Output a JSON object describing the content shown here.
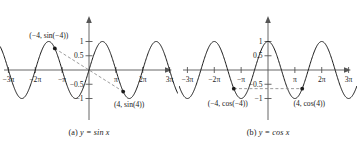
{
  "figure": {
    "panels": [
      {
        "id": "a",
        "caption_prefix": "(a) ",
        "caption_equation": "y = sin x",
        "curve_color": "#1a1a1a",
        "axis_color": "#555555",
        "dash_color": "#8a8a8a",
        "point_color": "#1a1a1a",
        "x_ticks": [
          "−3π",
          "−2π",
          "−π",
          "π",
          "2π",
          "3π"
        ],
        "y_ticks": [
          "1",
          "0.5",
          "−0.5",
          "−1"
        ],
        "points": [
          {
            "name": "point-neg4",
            "label": "(−4, sin(−4))",
            "x": -4,
            "y": 0.7568
          },
          {
            "name": "point-pos4",
            "label": "(4, sin(4))",
            "x": 4,
            "y": -0.7568
          }
        ],
        "symmetry": "odd",
        "symmetry_line": "dashed line through the origin connecting the two points"
      },
      {
        "id": "b",
        "caption_prefix": "(b) ",
        "caption_equation": "y = cos x",
        "curve_color": "#1a1a1a",
        "axis_color": "#555555",
        "dash_color": "#8a8a8a",
        "point_color": "#1a1a1a",
        "x_ticks": [
          "−3π",
          "−2π",
          "−π",
          "π",
          "2π",
          "3π"
        ],
        "y_ticks": [
          "1",
          "0.5",
          "−0.5",
          "−1"
        ],
        "points": [
          {
            "name": "point-neg4",
            "label": "(−4, cos(−4))",
            "x": -4,
            "y": -0.6536
          },
          {
            "name": "point-pos4",
            "label": "(4, cos(4))",
            "x": 4,
            "y": -0.6536
          }
        ],
        "symmetry": "even",
        "symmetry_line": "horizontal dashed line connecting the two points"
      }
    ]
  },
  "chart_data": [
    {
      "type": "line",
      "title": "(a) y = sin x",
      "function": "y = sin(x)",
      "xlabel": "x",
      "ylabel": "y",
      "xlim": [
        -10.4,
        10.4
      ],
      "ylim": [
        -1.25,
        1.25
      ],
      "grid": false,
      "legend": "none",
      "xticks": [
        -9.4248,
        -6.2832,
        -3.1416,
        3.1416,
        6.2832,
        9.4248
      ],
      "xticklabels": [
        "−3π",
        "−2π",
        "−π",
        "π",
        "2π",
        "3π"
      ],
      "yticks": [
        1,
        0.5,
        -0.5,
        -1
      ],
      "yticklabels": [
        "1",
        "0.5",
        "−0.5",
        "−1"
      ],
      "annotations": [
        {
          "label": "(−4, sin(−4))",
          "x": -4,
          "y": 0.7568
        },
        {
          "label": "(4, sin(4))",
          "x": 4,
          "y": -0.7568
        }
      ]
    },
    {
      "type": "line",
      "title": "(b) y = cos x",
      "function": "y = cos(x)",
      "xlabel": "x",
      "ylabel": "y",
      "xlim": [
        -10.4,
        10.4
      ],
      "ylim": [
        -1.25,
        1.25
      ],
      "grid": false,
      "legend": "none",
      "xticks": [
        -9.4248,
        -6.2832,
        -3.1416,
        3.1416,
        6.2832,
        9.4248
      ],
      "xticklabels": [
        "−3π",
        "−2π",
        "−π",
        "π",
        "2π",
        "3π"
      ],
      "yticks": [
        1,
        0.5,
        -0.5,
        -1
      ],
      "yticklabels": [
        "1",
        "0.5",
        "−0.5",
        "−1"
      ],
      "annotations": [
        {
          "label": "(−4, cos(−4))",
          "x": -4,
          "y": -0.6536
        },
        {
          "label": "(4, cos(4))",
          "x": 4,
          "y": -0.6536
        }
      ]
    }
  ]
}
